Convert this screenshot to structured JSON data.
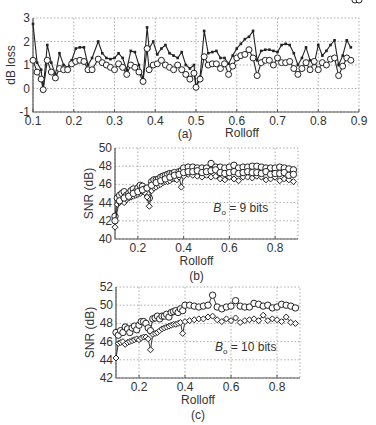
{
  "chart_data": [
    {
      "id": "a",
      "type": "line",
      "caption": "(a)",
      "xlabel": "Rolloff",
      "ylabel": "dB loss",
      "xlim": [
        0.1,
        0.9
      ],
      "ylim": [
        -1,
        3
      ],
      "xticks": [
        0.1,
        0.2,
        0.3,
        0.4,
        0.5,
        0.6,
        0.7,
        0.8,
        0.9
      ],
      "yticks": [
        -1,
        0,
        1,
        2,
        3
      ],
      "grid": true,
      "annotation": "",
      "plot_box": {
        "left": 33,
        "right": 359,
        "top": 18,
        "bottom": 112
      },
      "series": [
        {
          "name": "square-marker",
          "marker": "square",
          "x": [
            0.1,
            0.11,
            0.12,
            0.125,
            0.135,
            0.145,
            0.155,
            0.165,
            0.175,
            0.185,
            0.195,
            0.205,
            0.215,
            0.225,
            0.235,
            0.245,
            0.26,
            0.27,
            0.28,
            0.29,
            0.3,
            0.31,
            0.32,
            0.33,
            0.34,
            0.35,
            0.36,
            0.37,
            0.38,
            0.385,
            0.395,
            0.405,
            0.415,
            0.425,
            0.435,
            0.445,
            0.455,
            0.465,
            0.475,
            0.485,
            0.495,
            0.5,
            0.51,
            0.52,
            0.53,
            0.54,
            0.55,
            0.56,
            0.57,
            0.58,
            0.59,
            0.6,
            0.61,
            0.62,
            0.63,
            0.64,
            0.65,
            0.66,
            0.67,
            0.68,
            0.69,
            0.7,
            0.71,
            0.72,
            0.73,
            0.74,
            0.75,
            0.76,
            0.77,
            0.78,
            0.79,
            0.8,
            0.81,
            0.82,
            0.83,
            0.84,
            0.85,
            0.86,
            0.87,
            0.88,
            0.89,
            0.9
          ],
          "y": [
            2.75,
            1.1,
            0.8,
            0.0,
            1.85,
            1.1,
            0.6,
            1.5,
            1.0,
            0.9,
            1.2,
            1.7,
            1.75,
            1.75,
            1.0,
            1.3,
            2.0,
            1.5,
            1.3,
            1.25,
            1.3,
            1.5,
            1.3,
            0.8,
            1.6,
            1.55,
            1.0,
            0.4,
            2.6,
            1.7,
            2.0,
            1.45,
            1.7,
            1.85,
            1.5,
            1.4,
            1.3,
            1.55,
            1.0,
            0.85,
            1.0,
            0.1,
            0.5,
            2.45,
            1.5,
            1.55,
            1.6,
            1.3,
            1.3,
            1.05,
            1.4,
            1.7,
            1.9,
            2.1,
            2.2,
            2.45,
            1.2,
            1.6,
            1.65,
            1.65,
            1.6,
            1.55,
            1.85,
            1.9,
            1.85,
            1.5,
            1.0,
            1.3,
            1.75,
            1.2,
            1.05,
            1.85,
            1.4,
            1.6,
            1.85,
            2.05,
            1.0,
            1.4,
            2.05,
            1.75
          ]
        },
        {
          "name": "circle-marker",
          "marker": "circle",
          "x": [
            0.1,
            0.11,
            0.12,
            0.125,
            0.135,
            0.145,
            0.155,
            0.165,
            0.175,
            0.185,
            0.195,
            0.205,
            0.215,
            0.225,
            0.235,
            0.245,
            0.26,
            0.27,
            0.28,
            0.29,
            0.3,
            0.31,
            0.32,
            0.33,
            0.34,
            0.35,
            0.36,
            0.37,
            0.38,
            0.385,
            0.395,
            0.405,
            0.415,
            0.425,
            0.435,
            0.445,
            0.455,
            0.465,
            0.475,
            0.485,
            0.495,
            0.5,
            0.51,
            0.52,
            0.53,
            0.54,
            0.55,
            0.56,
            0.57,
            0.58,
            0.59,
            0.6,
            0.61,
            0.62,
            0.63,
            0.64,
            0.65,
            0.66,
            0.67,
            0.68,
            0.69,
            0.7,
            0.71,
            0.72,
            0.73,
            0.74,
            0.75,
            0.76,
            0.77,
            0.78,
            0.79,
            0.8,
            0.81,
            0.82,
            0.83,
            0.84,
            0.85,
            0.86,
            0.87,
            0.88,
            0.89,
            0.9
          ],
          "y": [
            1.2,
            0.7,
            0.4,
            -0.05,
            1.2,
            0.7,
            0.45,
            0.85,
            0.8,
            0.8,
            1.05,
            1.15,
            1.2,
            1.15,
            0.8,
            0.8,
            1.25,
            1.1,
            1.0,
            0.9,
            0.8,
            1.05,
            0.9,
            0.6,
            1.0,
            0.9,
            0.7,
            0.3,
            1.7,
            0.8,
            1.0,
            1.05,
            1.2,
            1.0,
            0.9,
            0.8,
            1.0,
            0.8,
            0.6,
            0.4,
            0.65,
            0.05,
            0.4,
            1.35,
            1.0,
            1.05,
            1.05,
            0.85,
            1.05,
            0.6,
            0.95,
            1.3,
            1.4,
            1.45,
            1.65,
            1.3,
            0.55,
            1.1,
            1.2,
            1.2,
            1.0,
            1.3,
            1.1,
            1.1,
            1.15,
            0.85,
            0.6,
            0.85,
            1.1,
            0.8,
            1.15,
            0.8,
            1.1,
            1.0,
            1.25,
            1.3,
            0.55,
            0.95,
            1.3,
            1.2
          ]
        }
      ]
    },
    {
      "id": "b",
      "type": "line",
      "caption": "(b)",
      "xlabel": "Rolloff",
      "ylabel": "SNR (dB)",
      "xlim": [
        0.1,
        0.9
      ],
      "ylim": [
        40,
        50
      ],
      "xticks": [
        0.2,
        0.4,
        0.6,
        0.8
      ],
      "yticks": [
        40,
        42,
        44,
        46,
        48,
        50
      ],
      "grid": true,
      "annotation": "B₀ = 9 bits",
      "plot_box": {
        "left": 115,
        "right": 298,
        "top": 148,
        "bottom": 239
      },
      "series": [
        {
          "name": "circle-marker",
          "marker": "circle",
          "x": [
            0.1,
            0.11,
            0.12,
            0.13,
            0.14,
            0.15,
            0.16,
            0.17,
            0.18,
            0.19,
            0.2,
            0.21,
            0.22,
            0.23,
            0.24,
            0.25,
            0.26,
            0.27,
            0.28,
            0.29,
            0.3,
            0.31,
            0.32,
            0.33,
            0.34,
            0.35,
            0.36,
            0.37,
            0.38,
            0.39,
            0.4,
            0.42,
            0.44,
            0.46,
            0.48,
            0.5,
            0.52,
            0.54,
            0.56,
            0.58,
            0.6,
            0.62,
            0.64,
            0.66,
            0.68,
            0.7,
            0.72,
            0.74,
            0.76,
            0.78,
            0.8,
            0.82,
            0.84,
            0.86,
            0.88
          ],
          "y": [
            42.5,
            44.5,
            44.8,
            45.0,
            45.2,
            44.8,
            45.0,
            45.3,
            45.5,
            45.2,
            45.6,
            45.9,
            45.8,
            45.5,
            45.0,
            44.5,
            46.3,
            46.5,
            46.5,
            46.6,
            46.8,
            46.9,
            47.0,
            47.1,
            47.2,
            47.2,
            47.3,
            47.0,
            47.4,
            47.5,
            47.8,
            47.9,
            47.9,
            47.8,
            47.8,
            47.8,
            48.3,
            47.9,
            47.9,
            47.8,
            47.9,
            48.1,
            47.8,
            47.9,
            47.9,
            48.0,
            48.0,
            47.9,
            47.8,
            47.8,
            47.8,
            47.9,
            47.8,
            47.7,
            47.6
          ]
        },
        {
          "name": "diamond-marker",
          "marker": "diamond",
          "x": [
            0.1,
            0.11,
            0.12,
            0.13,
            0.14,
            0.15,
            0.16,
            0.17,
            0.18,
            0.19,
            0.2,
            0.21,
            0.22,
            0.23,
            0.24,
            0.25,
            0.26,
            0.27,
            0.28,
            0.29,
            0.3,
            0.31,
            0.32,
            0.33,
            0.34,
            0.35,
            0.36,
            0.37,
            0.38,
            0.39,
            0.4,
            0.42,
            0.44,
            0.46,
            0.48,
            0.5,
            0.52,
            0.54,
            0.56,
            0.58,
            0.6,
            0.62,
            0.64,
            0.66,
            0.68,
            0.7,
            0.72,
            0.74,
            0.76,
            0.78,
            0.8,
            0.82,
            0.84,
            0.86,
            0.88
          ],
          "y": [
            41.3,
            43.8,
            44.0,
            44.2,
            44.0,
            44.3,
            44.5,
            44.6,
            44.7,
            44.8,
            44.9,
            45.0,
            45.2,
            45.1,
            44.6,
            43.6,
            45.3,
            45.6,
            45.7,
            45.9,
            46.0,
            46.2,
            46.3,
            46.3,
            46.4,
            46.6,
            46.6,
            46.5,
            46.8,
            45.7,
            46.9,
            47.1,
            47.0,
            46.9,
            46.8,
            47.0,
            46.8,
            46.9,
            46.6,
            46.5,
            46.8,
            46.6,
            46.4,
            46.8,
            46.8,
            46.7,
            46.9,
            46.8,
            46.5,
            46.6,
            46.8,
            46.4,
            46.6,
            46.5,
            46.3
          ]
        },
        {
          "name": "triangle-marker",
          "marker": "circle",
          "x": [
            0.1,
            0.12,
            0.14,
            0.16,
            0.18,
            0.2,
            0.22,
            0.24,
            0.26,
            0.28,
            0.3,
            0.32,
            0.34,
            0.36,
            0.38,
            0.4,
            0.42,
            0.44,
            0.46,
            0.48,
            0.5,
            0.52,
            0.54,
            0.56,
            0.58,
            0.6,
            0.62,
            0.64,
            0.66,
            0.68,
            0.7,
            0.72,
            0.74,
            0.76,
            0.78,
            0.8,
            0.82,
            0.84,
            0.86,
            0.88
          ],
          "y": [
            42.0,
            44.2,
            44.5,
            44.7,
            45.0,
            45.2,
            45.4,
            45.6,
            45.9,
            46.2,
            46.4,
            46.6,
            46.8,
            47.0,
            47.1,
            47.3,
            47.4,
            47.4,
            47.5,
            47.3,
            47.4,
            47.5,
            47.6,
            47.3,
            47.2,
            47.3,
            47.4,
            47.2,
            47.3,
            47.4,
            47.3,
            47.3,
            47.2,
            47.4,
            47.1,
            47.2,
            47.2,
            47.3,
            47.0,
            47.1
          ]
        }
      ]
    },
    {
      "id": "c",
      "type": "line",
      "caption": "(c)",
      "xlabel": "Rolloff",
      "ylabel": "SNR (dB)",
      "xlim": [
        0.1,
        0.9
      ],
      "ylim": [
        42,
        52
      ],
      "xticks": [
        0.2,
        0.4,
        0.6,
        0.8
      ],
      "yticks": [
        42,
        44,
        46,
        48,
        50,
        52
      ],
      "grid": true,
      "annotation": "B₀ = 10 bits",
      "plot_box": {
        "left": 116,
        "right": 300,
        "top": 287,
        "bottom": 378
      },
      "series": [
        {
          "name": "circle-marker",
          "marker": "circle",
          "x": [
            0.1,
            0.11,
            0.12,
            0.13,
            0.14,
            0.15,
            0.16,
            0.17,
            0.18,
            0.19,
            0.2,
            0.21,
            0.22,
            0.23,
            0.24,
            0.25,
            0.26,
            0.27,
            0.28,
            0.29,
            0.3,
            0.31,
            0.32,
            0.33,
            0.34,
            0.35,
            0.36,
            0.37,
            0.38,
            0.39,
            0.4,
            0.42,
            0.44,
            0.46,
            0.48,
            0.5,
            0.52,
            0.54,
            0.56,
            0.58,
            0.6,
            0.62,
            0.64,
            0.66,
            0.68,
            0.7,
            0.72,
            0.74,
            0.76,
            0.78,
            0.8,
            0.82,
            0.84,
            0.86,
            0.88
          ],
          "y": [
            47.0,
            46.7,
            47.2,
            47.0,
            47.6,
            47.4,
            47.0,
            47.5,
            47.7,
            47.3,
            47.8,
            48.2,
            48.2,
            48.0,
            47.5,
            47.2,
            48.5,
            48.6,
            48.8,
            48.5,
            48.8,
            48.8,
            49.0,
            48.7,
            49.2,
            49.3,
            49.4,
            49.2,
            49.6,
            49.4,
            50.0,
            50.0,
            49.9,
            49.8,
            49.9,
            50.0,
            51.1,
            49.8,
            49.6,
            49.8,
            49.9,
            50.5,
            49.9,
            49.8,
            49.8,
            50.2,
            50.1,
            49.9,
            50.0,
            49.7,
            49.8,
            50.1,
            50.0,
            49.9,
            49.7
          ]
        },
        {
          "name": "diamond-marker",
          "marker": "diamond",
          "x": [
            0.1,
            0.11,
            0.12,
            0.13,
            0.14,
            0.15,
            0.16,
            0.17,
            0.18,
            0.19,
            0.2,
            0.21,
            0.22,
            0.23,
            0.24,
            0.25,
            0.26,
            0.27,
            0.28,
            0.29,
            0.3,
            0.31,
            0.32,
            0.33,
            0.34,
            0.35,
            0.36,
            0.37,
            0.38,
            0.39,
            0.4,
            0.42,
            0.44,
            0.46,
            0.48,
            0.5,
            0.52,
            0.54,
            0.56,
            0.58,
            0.6,
            0.62,
            0.64,
            0.66,
            0.68,
            0.7,
            0.72,
            0.74,
            0.76,
            0.78,
            0.8,
            0.82,
            0.84,
            0.86,
            0.88
          ],
          "y": [
            44.2,
            45.8,
            45.9,
            46.0,
            45.7,
            45.9,
            46.0,
            46.1,
            46.2,
            46.3,
            46.2,
            46.4,
            46.5,
            46.5,
            46.3,
            45.1,
            46.8,
            46.9,
            47.0,
            47.2,
            47.4,
            47.5,
            47.6,
            47.7,
            47.8,
            47.9,
            47.9,
            48.0,
            48.1,
            46.9,
            48.2,
            48.3,
            48.4,
            48.5,
            48.5,
            48.7,
            48.8,
            48.4,
            48.2,
            48.5,
            48.3,
            48.6,
            48.1,
            48.3,
            48.4,
            48.5,
            48.3,
            48.9,
            48.3,
            48.5,
            48.4,
            48.2,
            48.7,
            48.1,
            48.0
          ]
        }
      ]
    }
  ]
}
